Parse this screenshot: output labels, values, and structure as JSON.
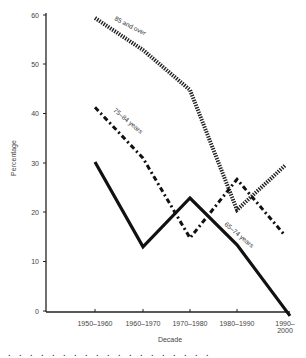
{
  "chart_data": {
    "type": "line",
    "title": "",
    "xlabel": "Decade",
    "ylabel": "Percentage",
    "ylim": [
      0,
      60
    ],
    "yticks": [
      0,
      10,
      20,
      30,
      40,
      50,
      60
    ],
    "categories": [
      "1950–1960",
      "1960–1970",
      "1970–1980",
      "1980–1990",
      "1990–2000"
    ],
    "grid": false,
    "legend": "inline labels along lines",
    "series": [
      {
        "name": "85 and over",
        "style": "dotted-thick",
        "values": [
          59.4,
          52.9,
          44.8,
          20.5,
          29.5
        ]
      },
      {
        "name": "75–84 years",
        "style": "dash-dot",
        "values": [
          41.3,
          31.0,
          14.8,
          26.7,
          15.3
        ]
      },
      {
        "name": "65–74 years",
        "style": "solid-thick",
        "values": [
          30.2,
          13.0,
          22.9,
          13.4,
          -1.0
        ]
      }
    ]
  },
  "axes": {
    "y_label": "Percentage",
    "x_label": "Decade",
    "y_ticks": [
      "0",
      "10",
      "20",
      "30",
      "40",
      "50",
      "60"
    ],
    "x_ticks": [
      "1950–1960",
      "1960–1970",
      "1970–1980",
      "1980–1990",
      "1990–"
    ],
    "x_tick_last_line2": "2000"
  },
  "labels": {
    "s85": "85 and over",
    "s75": "75–84 years",
    "s65": "65–74 years"
  },
  "caption": ". . .  . . . .    . .   .  .   . .   .  . .  .   . ."
}
